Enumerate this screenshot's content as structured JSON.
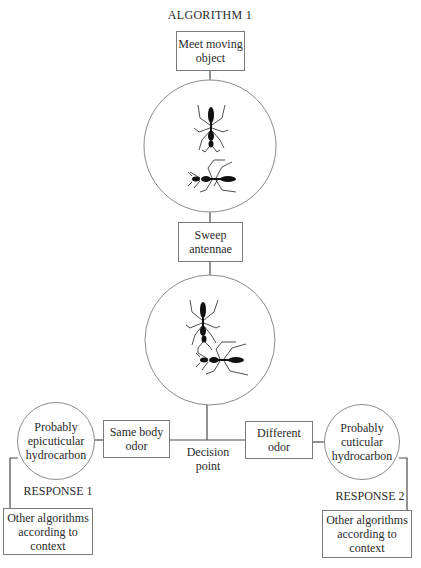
{
  "title": "ALGORITHM 1",
  "nodes": {
    "meet": "Meet moving object",
    "sweep": "Sweep antennae",
    "decision": "Decision point",
    "same_odor": "Same body odor",
    "different_odor": "Different odor",
    "epicuticular": "Probably epicuticular hydrocarbon",
    "cuticular": "Probably cuticular hydrocarbon",
    "response1": "RESPONSE 1",
    "response2": "RESPONSE 2",
    "other1": "Other algorithms according to context",
    "other2": "Other algorithms according to context"
  },
  "illustrations": {
    "circle1": "two-ants-meeting-icon",
    "circle2": "ants-antennating-icon"
  }
}
